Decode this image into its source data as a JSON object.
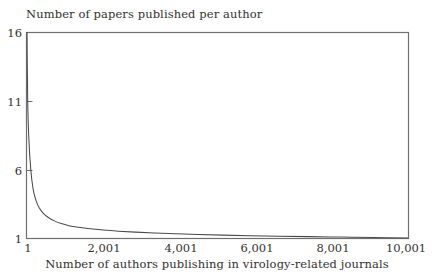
{
  "figure": {
    "background": "#ffffff",
    "ink_color": "#4a4a4a",
    "text_color": "#33312f"
  },
  "chart_data": {
    "type": "line",
    "title": "",
    "ylabel": "Number of papers published per author",
    "xlabel": "Number of authors publishing in virology-related journals",
    "xlim": [
      1,
      10001
    ],
    "ylim": [
      1,
      16
    ],
    "grid": false,
    "legend": null,
    "xticks": [
      1,
      2001,
      4001,
      6001,
      8001,
      10001
    ],
    "xtick_labels": [
      "1",
      "2,001",
      "4,001",
      "6,001",
      "8,001",
      "10,001"
    ],
    "yticks": [
      1,
      6,
      11,
      16
    ],
    "ytick_labels": [
      "1",
      "6",
      "11",
      "16"
    ],
    "series": [
      {
        "name": "papers per author",
        "x": [
          1,
          20,
          50,
          100,
          160,
          230,
          320,
          430,
          560,
          720,
          900,
          1100,
          1350,
          1650,
          2001,
          2400,
          2850,
          3350,
          3900,
          4500,
          5150,
          5850,
          6600,
          7400,
          8250,
          9100,
          10001
        ],
        "values": [
          16,
          11,
          8.2,
          6.0,
          4.6,
          3.8,
          3.2,
          2.8,
          2.5,
          2.25,
          2.05,
          1.9,
          1.78,
          1.67,
          1.58,
          1.5,
          1.43,
          1.37,
          1.31,
          1.26,
          1.21,
          1.17,
          1.13,
          1.1,
          1.07,
          1.04,
          1.0
        ]
      }
    ]
  }
}
